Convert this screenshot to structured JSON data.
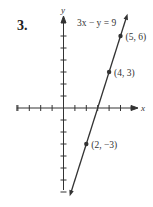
{
  "problem_number": "3.",
  "chart_data": {
    "type": "line",
    "title": "",
    "equation": "3x − y = 9",
    "xlabel": "x",
    "ylabel": "y",
    "xlim": [
      -4,
      6
    ],
    "ylim": [
      -7,
      7
    ],
    "grid": false,
    "x_ticks": [
      -4,
      -3,
      -2,
      -1,
      1,
      2,
      3,
      4,
      5
    ],
    "y_ticks": [
      -7,
      -6,
      -5,
      -4,
      -3,
      -2,
      -1,
      1,
      2,
      3,
      4,
      5,
      6
    ],
    "series": [
      {
        "name": "3x − y = 9",
        "points": [
          {
            "x": 5,
            "y": 6,
            "label": "(5, 6)"
          },
          {
            "x": 4,
            "y": 3,
            "label": "(4, 3)"
          },
          {
            "x": 2,
            "y": -3,
            "label": "(2, −3)"
          }
        ]
      }
    ]
  }
}
